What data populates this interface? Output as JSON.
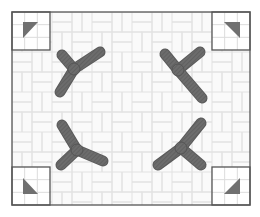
{
  "diagram": {
    "title": "",
    "frame": {
      "x": 12,
      "y": 12,
      "width": 238,
      "height": 193,
      "stroke": "#555555"
    },
    "background_pattern": "basketweave",
    "pattern_color": "#e2e2e2",
    "corner_boxes": [
      {
        "id": "top-left",
        "x": 12,
        "y": 12,
        "size": 38,
        "triangle": "top-left-pointing",
        "points": "23,22 38,22 23,38"
      },
      {
        "id": "top-right",
        "x": 212,
        "y": 12,
        "size": 38,
        "triangle": "top-right-pointing",
        "points": "224,22 240,22 240,38"
      },
      {
        "id": "bottom-left",
        "x": 12,
        "y": 167,
        "size": 38,
        "triangle": "bottom-left-pointing",
        "points": "23,178 23,194 38,194"
      },
      {
        "id": "bottom-right",
        "x": 212,
        "y": 167,
        "size": 38,
        "triangle": "bottom-right-pointing",
        "points": "240,178 240,194 224,194"
      }
    ],
    "triangle_color": "#707070",
    "propellers": [
      {
        "id": "top-left",
        "arms": [
          [
            74,
            69,
            62,
            55
          ],
          [
            74,
            69,
            100,
            52
          ],
          [
            74,
            69,
            60,
            92
          ]
        ]
      },
      {
        "id": "top-right",
        "arms": [
          [
            178,
            70,
            165,
            54
          ],
          [
            178,
            70,
            200,
            52
          ],
          [
            178,
            70,
            202,
            98
          ]
        ]
      },
      {
        "id": "bottom-left",
        "arms": [
          [
            77,
            150,
            62,
            125
          ],
          [
            77,
            150,
            103,
            161
          ],
          [
            77,
            150,
            61,
            165
          ]
        ]
      },
      {
        "id": "bottom-right",
        "arms": [
          [
            181,
            148,
            201,
            123
          ],
          [
            181,
            148,
            158,
            165
          ],
          [
            181,
            148,
            201,
            165
          ]
        ]
      }
    ],
    "propeller_color": "#6a6a6a"
  }
}
